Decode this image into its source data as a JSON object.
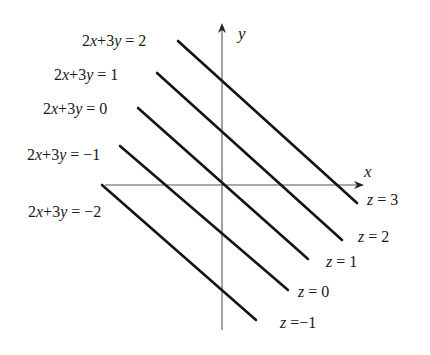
{
  "axes": {
    "x_label": "x",
    "y_label": "y",
    "origin": [
      222,
      185
    ],
    "x_axis": {
      "from": [
        105,
        185
      ],
      "to": [
        362,
        185
      ]
    },
    "y_axis": {
      "from": [
        222,
        330
      ],
      "to": [
        222,
        25
      ]
    }
  },
  "lines": [
    {
      "equation": "2x+3y = 2",
      "z_label": "z = 3",
      "start": [
        178,
        41
      ],
      "end": [
        357,
        203
      ]
    },
    {
      "equation": "2x+3y = 1",
      "z_label": "z = 2",
      "start": [
        157,
        73
      ],
      "end": [
        342,
        240
      ]
    },
    {
      "equation": "2x+3y = 0",
      "z_label": "z = 1",
      "start": [
        138,
        108
      ],
      "end": [
        308,
        259
      ]
    },
    {
      "equation": "2x+3y = −1",
      "z_label": "z = 0",
      "start": [
        120,
        146
      ],
      "end": [
        288,
        290
      ]
    },
    {
      "equation": "2x+3y = −2",
      "z_label": "z =−1",
      "start": [
        102,
        185
      ],
      "end": [
        256,
        320
      ]
    }
  ],
  "equation_labels": [
    {
      "text": "2x+3y = 2",
      "left": 82,
      "top": 33
    },
    {
      "text": "2x+3y = 1",
      "left": 54,
      "top": 67
    },
    {
      "text": "2x+3y = 0",
      "left": 43,
      "top": 101
    },
    {
      "text": "2x+3y = −1",
      "left": 27,
      "top": 147
    },
    {
      "text": "2x+3y = −2",
      "left": 28,
      "top": 204
    }
  ],
  "z_labels": [
    {
      "text": "z = 3",
      "left": 367,
      "top": 192
    },
    {
      "text": "z = 2",
      "left": 358,
      "top": 229
    },
    {
      "text": "z = 1",
      "left": 326,
      "top": 254
    },
    {
      "text": "z = 0",
      "left": 298,
      "top": 284
    },
    {
      "text": "z =−1",
      "left": 280,
      "top": 315
    }
  ],
  "colors": {
    "line": "#141414",
    "axis": "#555555",
    "text": "#1a1a1a"
  }
}
